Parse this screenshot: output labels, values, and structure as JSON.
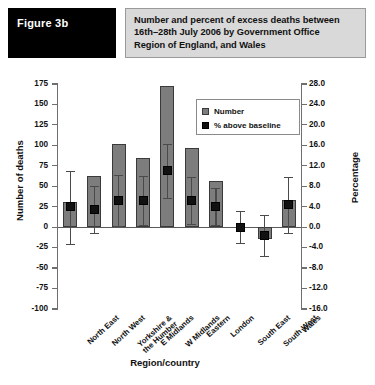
{
  "header": {
    "figure_badge": "Figure 3b",
    "title_lines": [
      "Number and percent of excess deaths between",
      "16th–28th July 2006 by Government Office",
      "Region of England, and Wales"
    ]
  },
  "legend": {
    "position": "inside-top-right",
    "entries": [
      {
        "label": "Number",
        "color": "#7d7d7d",
        "marker": "square-gray"
      },
      {
        "label": "% above baseline",
        "color": "#111111",
        "marker": "square-black"
      }
    ]
  },
  "chart_data": {
    "type": "bar",
    "title": "Number and percent of excess deaths between 16th–28th July 2006 by Government Office Region of England, and Wales",
    "xlabel": "Region/country",
    "ylabel": "Number of deaths",
    "y2label": "Percentage",
    "ylim": [
      -100,
      175
    ],
    "yticks": [
      -100,
      -75,
      -50,
      -25,
      0,
      25,
      50,
      75,
      100,
      125,
      150,
      175
    ],
    "ytick_labels": [
      "-100",
      "-75",
      "-50",
      "-25",
      "0",
      "25",
      "50",
      "75",
      "100",
      "125",
      "150",
      "175"
    ],
    "y2lim": [
      -16.0,
      28.0
    ],
    "y2ticks": [
      -16.0,
      -12.0,
      -8.0,
      -4.0,
      0.0,
      4.0,
      8.0,
      12.0,
      16.0,
      20.0,
      24.0,
      28.0
    ],
    "y2tick_labels": [
      "-16.0",
      "-12.0",
      "-8.0",
      "-4.0",
      "0.0",
      "4.0",
      "8.0",
      "12.0",
      "16.0",
      "20.0",
      "24.0",
      "28.0"
    ],
    "grid": false,
    "categories": [
      "North East",
      "North West",
      "Yorkshire &\nthe Humber",
      "E Midlands",
      "W Midlands",
      "Eastern",
      "London",
      "South East",
      "South West",
      "Wales"
    ],
    "series": [
      {
        "name": "Number",
        "axis": "left",
        "type": "bar",
        "values": [
          31,
          62,
          102,
          84,
          172,
          97,
          57,
          0,
          -14,
          33
        ]
      },
      {
        "name": "% above baseline",
        "axis": "right",
        "type": "marker",
        "values": [
          4.0,
          3.5,
          5.3,
          5.2,
          11.0,
          5.2,
          4.0,
          0.0,
          -1.6,
          4.4
        ],
        "error_low": [
          -3.2,
          -1.2,
          0.3,
          0.4,
          5.8,
          0.6,
          0.4,
          -3.1,
          -5.6,
          -1.2
        ],
        "error_high": [
          11.0,
          8.1,
          10.3,
          10.0,
          16.2,
          9.8,
          7.6,
          3.1,
          2.4,
          9.8
        ]
      }
    ]
  }
}
